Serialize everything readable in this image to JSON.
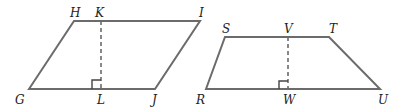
{
  "figures": {
    "parallelogram": {
      "vertices": [
        "G",
        "H",
        "I",
        "J"
      ],
      "height_segment": "KL",
      "labels": {
        "H": "H",
        "K": "K",
        "I": "I",
        "G": "G",
        "L": "L",
        "J": "J"
      }
    },
    "trapezoid": {
      "vertices": [
        "R",
        "S",
        "T",
        "U"
      ],
      "height_segment": "VW",
      "labels": {
        "S": "S",
        "V": "V",
        "T": "T",
        "R": "R",
        "W": "W",
        "U": "U"
      }
    }
  },
  "colors": {
    "stroke": "#6b6b6b",
    "text": "#222222"
  }
}
